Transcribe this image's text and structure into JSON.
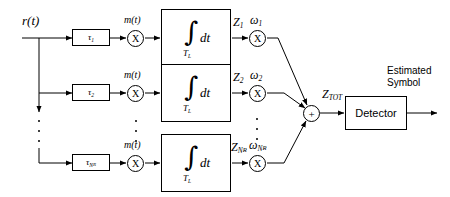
{
  "diagram": {
    "input_label": "r(t)",
    "branch_signal_label": "m(t)",
    "integrator": {
      "integral_glyph": "∫",
      "differential": "dt",
      "lower_limit": "T",
      "lower_limit_sub": "L"
    },
    "branches": [
      {
        "delay": "τ",
        "delay_sub": "1",
        "mult_glyph": "X",
        "output": "Z",
        "output_sub": "1",
        "weight": "ω",
        "weight_sub": "1"
      },
      {
        "delay": "τ",
        "delay_sub": "2",
        "mult_glyph": "X",
        "output": "Z",
        "output_sub": "2",
        "weight": "ω",
        "weight_sub": "2"
      },
      {
        "delay": "τ",
        "delay_sub": "N",
        "delay_subsub": "R",
        "mult_glyph": "X",
        "output": "Z",
        "output_sub": "N",
        "output_subsub": "R",
        "weight": "ω",
        "weight_sub": "N",
        "weight_subsub": "R"
      }
    ],
    "summer": {
      "glyph": "+",
      "output_label": "Z",
      "output_sub": "TOT"
    },
    "detector": {
      "label": "Detector"
    },
    "output": {
      "line1": "Estimated",
      "line2": "Symbol"
    },
    "colors": {
      "stroke": "#000000",
      "background": "#ffffff"
    }
  }
}
